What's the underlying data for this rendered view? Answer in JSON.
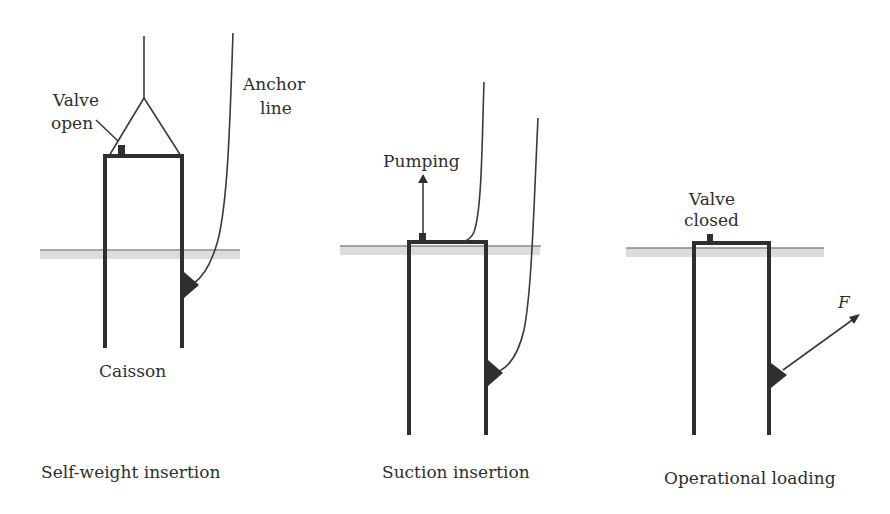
{
  "figure": {
    "panels": [
      {
        "id": "self-weight",
        "caption": "Self-weight insertion",
        "labels": {
          "valve": [
            "Valve",
            "open"
          ],
          "anchor_line": [
            "Anchor",
            "line"
          ],
          "caisson": "Caisson"
        }
      },
      {
        "id": "suction",
        "caption": "Suction insertion",
        "labels": {
          "pumping": "Pumping"
        }
      },
      {
        "id": "operational",
        "caption": "Operational loading",
        "labels": {
          "valve": [
            "Valve",
            "closed"
          ],
          "force": "F"
        }
      }
    ],
    "colors": {
      "stroke": "#2f2f2f",
      "ground": "#dcdcdc",
      "background": "#ffffff"
    }
  }
}
